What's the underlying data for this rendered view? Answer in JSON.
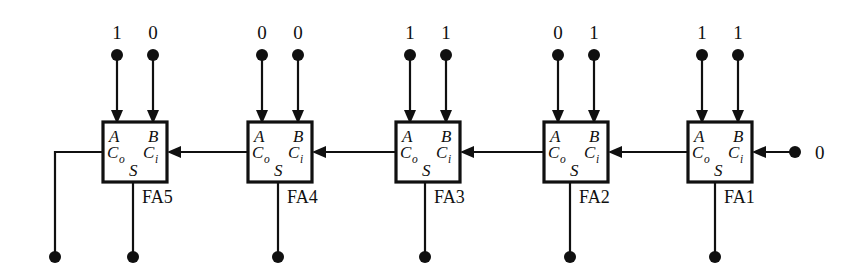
{
  "diagram": {
    "type": "logic-circuit",
    "width": 850,
    "height": 279,
    "line_color": "#101010",
    "background": "#ffffff",
    "port_labels": {
      "a": "A",
      "b": "B",
      "carry_out": "C",
      "carry_out_sub": "o",
      "carry_in": "C",
      "carry_in_sub": "i",
      "sum": "S"
    },
    "blocks": [
      {
        "name": "FA5",
        "x": 103,
        "a_value": "1",
        "b_value": "0",
        "a_dot_x": 117,
        "b_dot_x": 153
      },
      {
        "name": "FA4",
        "x": 248,
        "a_value": "0",
        "b_value": "0",
        "a_dot_x": 262,
        "b_dot_x": 298
      },
      {
        "name": "FA3",
        "x": 396,
        "a_value": "1",
        "b_value": "1",
        "a_dot_x": 410,
        "b_dot_x": 446
      },
      {
        "name": "FA2",
        "x": 544,
        "a_value": "0",
        "b_value": "1",
        "a_dot_x": 558,
        "b_dot_x": 594
      },
      {
        "name": "FA1",
        "x": 688,
        "a_value": "1",
        "b_value": "1",
        "a_dot_x": 702,
        "b_dot_x": 738
      }
    ],
    "carry_in_source": {
      "value": "0",
      "dot_x": 795,
      "label_x": 815
    },
    "geometry": {
      "box_width": 64,
      "box_height": 60,
      "box_top": 122,
      "carry_line_y": 152,
      "input_dot_y": 55,
      "input_label_y": 39,
      "output_dot_y": 257,
      "final_carry_x": 55,
      "block_label_dy": 21
    }
  }
}
